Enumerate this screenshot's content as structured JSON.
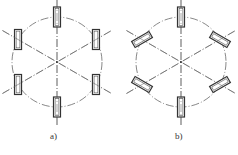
{
  "figures": [
    {
      "id": "a",
      "label": "a)",
      "center": [
        57,
        62
      ],
      "radius": 45,
      "block_angles_deg": [
        90,
        30,
        -30,
        -90,
        -150,
        150
      ],
      "block_orientation": "vertical",
      "label_pos": [
        50,
        137
      ]
    },
    {
      "id": "b",
      "label": "b)",
      "center": [
        181,
        62
      ],
      "radius": 45,
      "block_angles_deg": [
        90,
        30,
        -30,
        -90,
        -150,
        150
      ],
      "block_orientation": "radial",
      "label_pos": [
        175,
        137
      ]
    }
  ],
  "colors": {
    "line": "#333333",
    "centerline": "#555555"
  }
}
